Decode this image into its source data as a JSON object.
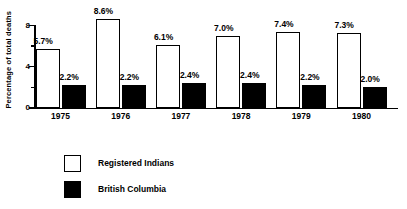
{
  "chart_data": {
    "type": "bar",
    "title": "",
    "xlabel": "",
    "ylabel": "Percentage of total deaths",
    "categories": [
      "1975",
      "1976",
      "1977",
      "1978",
      "1979",
      "1980"
    ],
    "series": [
      {
        "name": "Registered Indians",
        "style": "light",
        "values": [
          5.7,
          8.6,
          6.1,
          7.0,
          7.4,
          7.3
        ],
        "labels": [
          "5.7%",
          "8.6%",
          "6.1%",
          "7.0%",
          "7.4%",
          "7.3%"
        ]
      },
      {
        "name": "British Columbia",
        "style": "dark",
        "values": [
          2.2,
          2.2,
          2.4,
          2.4,
          2.2,
          2.0
        ],
        "labels": [
          "2.2%",
          "2.2%",
          "2.4%",
          "2.4%",
          "2.2%",
          "2.0%"
        ]
      }
    ],
    "ylim": [
      0,
      8
    ],
    "yticks_major": [
      0,
      4,
      8
    ],
    "yticks_major_labels": [
      "0",
      "4",
      "8"
    ],
    "yticks_minor": [
      2,
      6
    ],
    "grid": false,
    "legend_position": "bottom-left",
    "colors": {
      "axis": "#000000",
      "text": "#000000",
      "series_light_fill": "#ffffff",
      "series_dark_fill": "#000000",
      "background": "#ffffff"
    }
  },
  "legend": {
    "entries": [
      {
        "label": "Registered Indians",
        "swatch": "light-square-swatch"
      },
      {
        "label": "British Columbia",
        "swatch": "dark-square-swatch"
      }
    ]
  }
}
